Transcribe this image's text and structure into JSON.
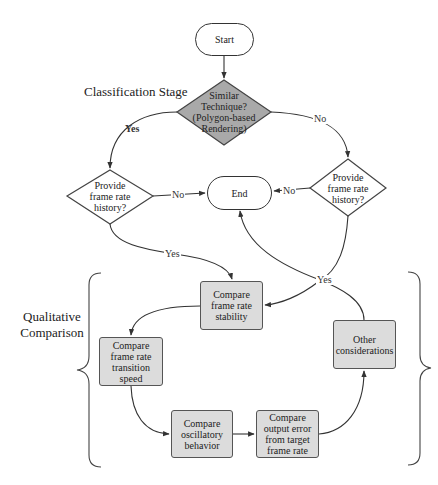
{
  "diagram": {
    "stages": {
      "classification": "Classification Stage",
      "qualitative_line1": "Qualitative",
      "qualitative_line2": "Comparison"
    },
    "nodes": {
      "start": {
        "label": "Start",
        "shape": "terminal"
      },
      "similar_technique": {
        "line1": "Similar",
        "line2": "Technique?",
        "line3": "(Polygon-based",
        "line4": "Rendering)",
        "shape": "decision",
        "fill": "#a9a9a9"
      },
      "history_left": {
        "line1": "Provide",
        "line2": "frame rate",
        "line3": "history?",
        "shape": "decision",
        "fill": "#ffffff"
      },
      "history_right": {
        "line1": "Provide",
        "line2": "frame rate",
        "line3": "history?",
        "shape": "decision",
        "fill": "#ffffff"
      },
      "end": {
        "label": "End",
        "shape": "terminal"
      },
      "stability": {
        "line1": "Compare",
        "line2": "frame rate",
        "line3": "stability",
        "shape": "process",
        "fill": "#dcdcdc"
      },
      "transition": {
        "line1": "Compare",
        "line2": "frame rate",
        "line3": "transition",
        "line4": "speed",
        "shape": "process",
        "fill": "#dcdcdc"
      },
      "oscillatory": {
        "line1": "Compare",
        "line2": "oscillatory",
        "line3": "behavior",
        "shape": "process",
        "fill": "#dcdcdc"
      },
      "output_error": {
        "line1": "Compare",
        "line2": "output error",
        "line3": "from target",
        "line4": "frame rate",
        "shape": "process",
        "fill": "#dcdcdc"
      },
      "other": {
        "line1": "Other",
        "line2": "considerations",
        "shape": "process",
        "fill": "#dcdcdc"
      }
    },
    "edge_labels": {
      "similar_yes": "Yes",
      "similar_no": "No",
      "left_no": "No",
      "right_no": "No",
      "left_yes": "Yes",
      "right_yes": "Yes"
    },
    "edges": [
      {
        "from": "start",
        "to": "similar_technique"
      },
      {
        "from": "similar_technique",
        "to": "history_left",
        "label": "Yes"
      },
      {
        "from": "similar_technique",
        "to": "history_right",
        "label": "No"
      },
      {
        "from": "history_left",
        "to": "end",
        "label": "No"
      },
      {
        "from": "history_right",
        "to": "end",
        "label": "No"
      },
      {
        "from": "history_left",
        "to": "stability",
        "label": "Yes"
      },
      {
        "from": "history_right",
        "to": "stability",
        "label": "Yes"
      },
      {
        "from": "stability",
        "to": "transition"
      },
      {
        "from": "transition",
        "to": "oscillatory"
      },
      {
        "from": "oscillatory",
        "to": "output_error"
      },
      {
        "from": "output_error",
        "to": "other"
      },
      {
        "from": "other",
        "to": "end"
      }
    ],
    "colors": {
      "line": "#333333",
      "process_fill": "#dcdcdc",
      "decision_gray_fill": "#a9a9a9"
    }
  }
}
